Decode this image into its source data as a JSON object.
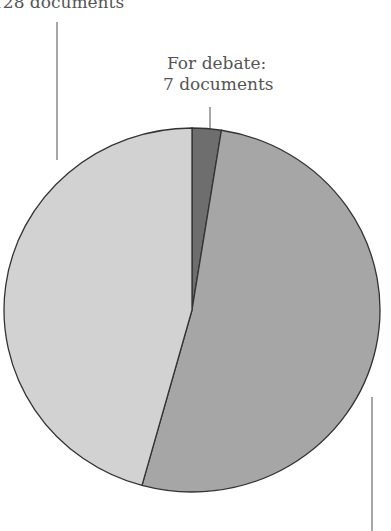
{
  "chart_data": {
    "type": "pie",
    "title": "",
    "slices": [
      {
        "label": "For debate",
        "value": 7,
        "display": "7 documents",
        "color": "#6e6e6e"
      },
      {
        "label": "",
        "value": 145,
        "display": "",
        "color": "#a6a6a6"
      },
      {
        "label": "",
        "value": 128,
        "display": "128 documents",
        "color": "#d2d2d2"
      }
    ],
    "start_angle_deg": 0,
    "direction": "clockwise"
  },
  "labels": {
    "top_left": "128 documents",
    "top_center_line1": "For debate:",
    "top_center_line2": "7 documents"
  }
}
